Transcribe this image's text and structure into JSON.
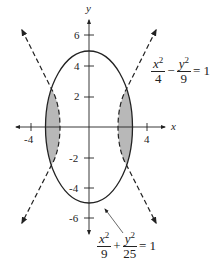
{
  "figure": {
    "axes": {
      "x_label": "x",
      "y_label": "y",
      "x_ticks": [
        {
          "value": -4,
          "label": "-4"
        },
        {
          "value": 4,
          "label": "4"
        }
      ],
      "y_ticks": [
        {
          "value": 6,
          "label": "6"
        },
        {
          "value": 4,
          "label": "4"
        },
        {
          "value": 2,
          "label": "2"
        },
        {
          "value": -2,
          "label": "-2"
        },
        {
          "value": -4,
          "label": "-4"
        },
        {
          "value": -6,
          "label": "-6"
        }
      ]
    },
    "hyperbola_equation": {
      "term1_num_var": "x",
      "term1_num_exp": "2",
      "term1_den": "4",
      "operator": "−",
      "term2_num_var": "y",
      "term2_num_exp": "2",
      "term2_den": "9",
      "rhs": "= 1"
    },
    "ellipse_equation": {
      "term1_num_var": "x",
      "term1_num_exp": "2",
      "term1_den": "9",
      "operator": "+",
      "term2_num_var": "y",
      "term2_num_exp": "2",
      "term2_den": "25",
      "rhs": "= 1"
    },
    "curves": [
      {
        "name": "ellipse",
        "equation": "x^2/9 + y^2/25 = 1",
        "style": "solid"
      },
      {
        "name": "hyperbola",
        "equation": "x^2/4 - y^2/9 = 1",
        "style": "dashed"
      }
    ],
    "shaded_region": "region inside ellipse and outside hyperbola branches near x-axis",
    "colors": {
      "ink": "#222222",
      "shade": "#b8b8b8"
    }
  }
}
